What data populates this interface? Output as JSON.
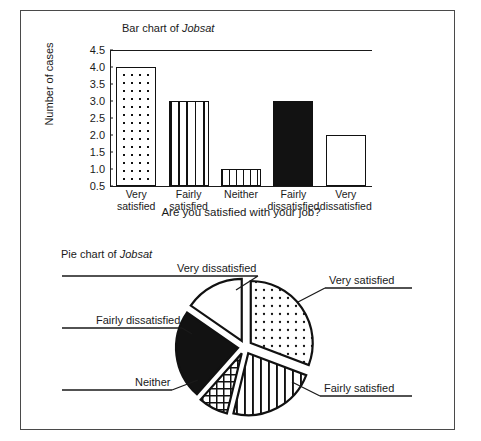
{
  "figure": {
    "border_color": "#4a4a4a",
    "background": "#ffffff"
  },
  "bar_chart": {
    "title_prefix": "Bar chart of ",
    "title_variable": "Jobsat",
    "ylabel": "Number of cases",
    "xlabel": "Are you satisfied with your job?"
  },
  "pie_chart": {
    "title_prefix": "Pie chart of ",
    "title_variable": "Jobsat",
    "labels": {
      "very_dissatisfied": "Very dissatisfied",
      "fairly_dissatisfied": "Fairly dissatisfied",
      "neither": "Neither",
      "very_satisfied": "Very satisfied",
      "fairly_satisfied": "Fairly satisfied"
    }
  },
  "chart_data": [
    {
      "type": "bar",
      "title": "Bar chart of Jobsat",
      "xlabel": "Are you satisfied with your job?",
      "ylabel": "Number of cases",
      "categories": [
        "Very satisfied",
        "Fairly satisfied",
        "Neither",
        "Fairly dissatisfied",
        "Very dissatisfied"
      ],
      "category_lines": [
        [
          "Very",
          "satisfied"
        ],
        [
          "Fairly",
          "satisfied"
        ],
        [
          "Neither",
          ""
        ],
        [
          "Fairly",
          "dissatisfied"
        ],
        [
          "Very",
          "dissatisfied"
        ]
      ],
      "values": [
        4,
        3,
        1,
        3,
        2
      ],
      "ylim": [
        0.5,
        4.5
      ],
      "yticks": [
        0.5,
        1.0,
        1.5,
        2.0,
        2.5,
        3.0,
        3.5,
        4.0,
        4.5
      ],
      "ytick_labels": [
        "0.5",
        "1.0",
        "1.5",
        "2.0",
        "2.5",
        "3.0",
        "3.5",
        "4.0",
        "4.5"
      ],
      "grid": false,
      "legend": "none",
      "fill_patterns": [
        "dots",
        "vertical-lines",
        "grid-crosshatch",
        "solid-black",
        "empty-white"
      ]
    },
    {
      "type": "pie",
      "title": "Pie chart of Jobsat",
      "exploded": true,
      "labels": [
        "Very satisfied",
        "Fairly satisfied",
        "Neither",
        "Fairly dissatisfied",
        "Very dissatisfied"
      ],
      "values": [
        4,
        3,
        1,
        3,
        2
      ],
      "percentages": [
        30.8,
        23.1,
        7.7,
        23.1,
        15.4
      ],
      "fill_patterns": [
        "dots",
        "vertical-lines",
        "grid-crosshatch",
        "solid-black",
        "empty-white"
      ],
      "legend": "callout-labels",
      "label_positions": [
        "right-top",
        "right-bottom",
        "left-bottom",
        "left-middle",
        "left-top"
      ]
    }
  ]
}
